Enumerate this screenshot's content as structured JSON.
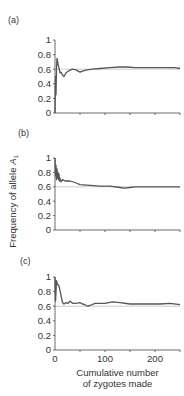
{
  "chart_data": [
    {
      "type": "line",
      "panel": "(a)",
      "xlabel": "",
      "ylabel": "Frequency of allele A1",
      "ylim": [
        0,
        1
      ],
      "xlim": [
        0,
        250
      ],
      "yticks": [
        "0",
        "0.2",
        "0.4",
        "0.6",
        "0.8",
        "1"
      ],
      "reference_line": 0.6,
      "series": [
        {
          "name": "allele A1 frequency",
          "x": [
            0,
            1,
            2,
            3,
            4,
            5,
            6,
            8,
            10,
            12,
            15,
            18,
            22,
            28,
            35,
            42,
            50,
            58,
            65,
            75,
            90,
            110,
            130,
            145,
            160,
            180,
            200,
            220,
            240,
            250
          ],
          "y": [
            0.0,
            0.5,
            0.25,
            0.6,
            0.75,
            0.72,
            0.67,
            0.62,
            0.55,
            0.56,
            0.52,
            0.5,
            0.55,
            0.58,
            0.6,
            0.59,
            0.56,
            0.58,
            0.59,
            0.6,
            0.61,
            0.62,
            0.63,
            0.63,
            0.62,
            0.62,
            0.62,
            0.62,
            0.62,
            0.61
          ]
        }
      ]
    },
    {
      "type": "line",
      "panel": "(b)",
      "xlabel": "",
      "ylabel": "Frequency of allele A1",
      "ylim": [
        0,
        1
      ],
      "xlim": [
        0,
        250
      ],
      "yticks": [
        "0",
        "0.2",
        "0.4",
        "0.6",
        "0.8",
        "1"
      ],
      "reference_line": 0.6,
      "series": [
        {
          "name": "allele A1 frequency",
          "x": [
            0,
            1,
            2,
            3,
            4,
            5,
            6,
            7,
            8,
            9,
            10,
            12,
            15,
            20,
            30,
            40,
            50,
            70,
            90,
            110,
            130,
            140,
            150,
            160,
            180,
            200,
            220,
            240,
            250
          ],
          "y": [
            1.0,
            0.75,
            0.9,
            0.7,
            0.85,
            0.72,
            0.8,
            0.7,
            0.78,
            0.68,
            0.72,
            0.67,
            0.7,
            0.68,
            0.68,
            0.66,
            0.63,
            0.62,
            0.61,
            0.61,
            0.59,
            0.58,
            0.59,
            0.6,
            0.6,
            0.6,
            0.6,
            0.6,
            0.6
          ]
        }
      ]
    },
    {
      "type": "line",
      "panel": "(c)",
      "xlabel": "Cumulative number of zygotes made",
      "ylabel": "Frequency of allele A1",
      "ylim": [
        0,
        1
      ],
      "xlim": [
        0,
        250
      ],
      "xticks": [
        "0",
        "100",
        "200"
      ],
      "yticks": [
        "0",
        "0.2",
        "0.4",
        "0.6",
        "0.8",
        "1"
      ],
      "reference_line": 0.6,
      "series": [
        {
          "name": "allele A1 frequency",
          "x": [
            0,
            1,
            2,
            3,
            5,
            8,
            12,
            15,
            18,
            22,
            26,
            30,
            35,
            40,
            50,
            55,
            60,
            65,
            70,
            80,
            90,
            100,
            115,
            130,
            150,
            170,
            190,
            210,
            230,
            250
          ],
          "y": [
            1.0,
            0.67,
            0.8,
            0.95,
            0.9,
            0.88,
            0.75,
            0.65,
            0.63,
            0.65,
            0.64,
            0.67,
            0.64,
            0.64,
            0.65,
            0.63,
            0.62,
            0.6,
            0.61,
            0.64,
            0.64,
            0.64,
            0.66,
            0.65,
            0.63,
            0.63,
            0.63,
            0.63,
            0.64,
            0.62
          ]
        }
      ]
    }
  ],
  "labels": {
    "panel_a": "(a)",
    "panel_b": "(b)",
    "panel_c": "(c)",
    "ylabel_prefix": "Frequency of allele ",
    "ylabel_symbol": "A",
    "ylabel_sub": "1",
    "xlabel_line1": "Cumulative number",
    "xlabel_line2": "of zygotes made"
  },
  "colors": {
    "line": "#555555",
    "axis": "#444444",
    "reference": "#aaaaaa",
    "text": "#333333"
  }
}
